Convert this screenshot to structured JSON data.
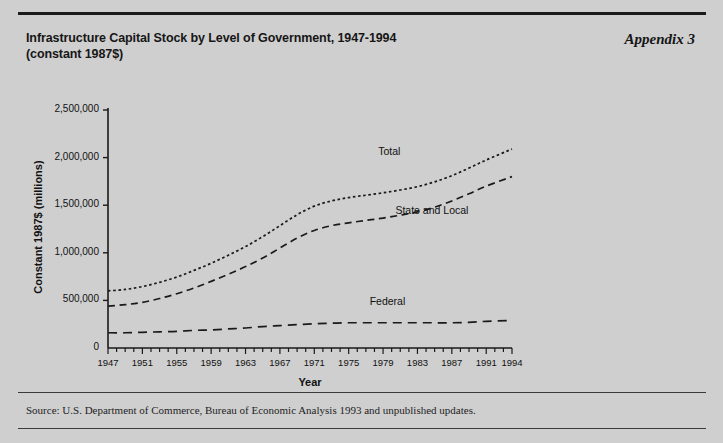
{
  "figure": {
    "title_line1": "Infrastructure Capital Stock by Level of Government, 1947-1994",
    "title_line2": "(constant 1987$)",
    "appendix_label": "Appendix 3",
    "source_note": "Source: U.S. Department of Commerce, Bureau of Economic Analysis 1993 and unpublished updates."
  },
  "chart_data": {
    "type": "line",
    "title": "Infrastructure Capital Stock by Level of Government, 1947-1994 (constant 1987$)",
    "xlabel": "Year",
    "ylabel": "Constant 1987$ (millions)",
    "xlim": [
      1947,
      1994
    ],
    "ylim": [
      0,
      2500000
    ],
    "grid": false,
    "legend_position": "inline-annotations",
    "ytick_labels": [
      "0",
      "500,000",
      "1,000,000",
      "1,500,000",
      "2,000,000",
      "2,500,000"
    ],
    "ytick_values": [
      0,
      500000,
      1000000,
      1500000,
      2000000,
      2500000
    ],
    "xtick_labels": [
      "1947",
      "1951",
      "1955",
      "1959",
      "1963",
      "1967",
      "1971",
      "1975",
      "1979",
      "1983",
      "1987",
      "1991",
      "1994"
    ],
    "xtick_values": [
      1947,
      1951,
      1955,
      1959,
      1963,
      1967,
      1971,
      1975,
      1979,
      1983,
      1987,
      1991,
      1994
    ],
    "x": [
      1947,
      1949,
      1951,
      1953,
      1955,
      1957,
      1959,
      1961,
      1963,
      1965,
      1967,
      1969,
      1971,
      1973,
      1975,
      1977,
      1979,
      1981,
      1983,
      1985,
      1987,
      1989,
      1991,
      1994
    ],
    "series": [
      {
        "name": "Total",
        "style": "dotted",
        "values": [
          600000,
          615000,
          645000,
          690000,
          745000,
          815000,
          890000,
          975000,
          1065000,
          1170000,
          1285000,
          1400000,
          1490000,
          1545000,
          1580000,
          1605000,
          1630000,
          1660000,
          1695000,
          1745000,
          1810000,
          1890000,
          1975000,
          2090000
        ]
      },
      {
        "name": "State and Local",
        "style": "dashed",
        "values": [
          440000,
          455000,
          480000,
          520000,
          570000,
          630000,
          700000,
          775000,
          855000,
          945000,
          1050000,
          1155000,
          1235000,
          1285000,
          1315000,
          1340000,
          1365000,
          1395000,
          1430000,
          1480000,
          1545000,
          1620000,
          1700000,
          1800000
        ]
      },
      {
        "name": "Federal",
        "style": "long-dashed",
        "values": [
          160000,
          160000,
          165000,
          170000,
          175000,
          185000,
          190000,
          200000,
          210000,
          225000,
          235000,
          245000,
          255000,
          260000,
          265000,
          265000,
          265000,
          265000,
          265000,
          265000,
          265000,
          270000,
          280000,
          290000
        ]
      }
    ],
    "annotations": [
      {
        "text": "Total",
        "x": 1981,
        "y": 2060000
      },
      {
        "text": "State and Local",
        "x": 1983,
        "y": 1440000
      },
      {
        "text": "Federal",
        "x": 1980,
        "y": 480000
      }
    ],
    "colors": {
      "line": "#1a1a1a",
      "axis": "#1a1a1a",
      "background": "#d5d5d5"
    }
  }
}
